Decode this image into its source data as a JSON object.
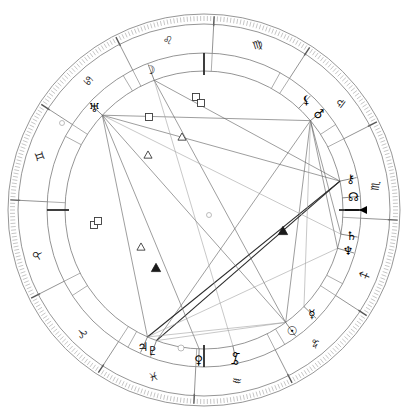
{
  "chart": {
    "type": "astrological-wheel",
    "center": {
      "x": 204,
      "y": 210
    },
    "radii": {
      "outer_edge": 196,
      "tick_outer": 194,
      "tick_inner": 186,
      "sign_ring_outer": 186,
      "sign_ring_inner": 157,
      "house_ring_outer": 157,
      "house_ring_inner": 139,
      "planet_ring": 150,
      "aspect_circle": 139
    },
    "rotation_note": "Ascendant at left (9 o'clock), zodiac increasing counter-clockwise",
    "asc_marker": {
      "label": "Ascendant",
      "angle_deg": 180,
      "symbol": "arrow-left"
    }
  },
  "zodiac_signs": [
    {
      "name": "Leo",
      "symbol": "♌",
      "angle_deg": 78,
      "label_angle": 78
    },
    {
      "name": "Cancer",
      "symbol": "♋",
      "angle_deg": 48,
      "label_angle": 48
    },
    {
      "name": "Gemini",
      "symbol": "♊",
      "angle_deg": 18,
      "label_angle": 18
    },
    {
      "name": "Taurus",
      "symbol": "♉",
      "angle_deg": 345,
      "label_angle": 345
    },
    {
      "name": "Aries",
      "symbol": "♈",
      "angle_deg": 315,
      "label_angle": 315
    },
    {
      "name": "Pisces",
      "symbol": "♓",
      "angle_deg": 287,
      "label_angle": 287
    },
    {
      "name": "Aquarius",
      "symbol": "♒",
      "angle_deg": 259,
      "label_angle": 259
    },
    {
      "name": "Capricorn",
      "symbol": "♑",
      "angle_deg": 230,
      "label_angle": 230
    },
    {
      "name": "Sagittarius",
      "symbol": "♐",
      "angle_deg": 202,
      "label_angle": 202
    },
    {
      "name": "Scorpio",
      "symbol": "♏",
      "angle_deg": 172,
      "label_angle": 172
    },
    {
      "name": "Libra",
      "symbol": "♎",
      "angle_deg": 142,
      "label_angle": 142
    },
    {
      "name": "Virgo",
      "symbol": "♍",
      "angle_deg": 108,
      "label_angle": 108
    }
  ],
  "sign_cusps_deg": [
    3,
    33,
    63,
    93,
    123,
    153,
    183,
    213,
    243,
    273,
    303,
    333
  ],
  "house_cusps": [
    {
      "house": 1,
      "angle_deg": 180,
      "major": true
    },
    {
      "house": 2,
      "angle_deg": 208,
      "major": false
    },
    {
      "house": 3,
      "angle_deg": 239,
      "major": false
    },
    {
      "house": 4,
      "angle_deg": 270,
      "major": true
    },
    {
      "house": 5,
      "angle_deg": 299,
      "major": false
    },
    {
      "house": 6,
      "angle_deg": 327,
      "major": false
    },
    {
      "house": 7,
      "angle_deg": 0,
      "major": true
    },
    {
      "house": 8,
      "angle_deg": 28,
      "major": false
    },
    {
      "house": 9,
      "angle_deg": 59,
      "major": false
    },
    {
      "house": 10,
      "angle_deg": 90,
      "major": true
    },
    {
      "house": 11,
      "angle_deg": 119,
      "major": false
    },
    {
      "house": 12,
      "angle_deg": 147,
      "major": false
    }
  ],
  "planets": [
    {
      "name": "Moon",
      "symbol": "☽",
      "angle_deg": 69,
      "label_r": 150,
      "point_r": 139
    },
    {
      "name": "Uranus",
      "symbol": "♅",
      "angle_deg": 43,
      "label_r": 150,
      "point_r": 139
    },
    {
      "name": "Mars",
      "symbol": "♂",
      "angle_deg": 140,
      "label_r": 150,
      "point_r": 139
    },
    {
      "name": "Lilith",
      "symbol": "⚸",
      "angle_deg": 133,
      "label_r": 150,
      "point_r": 139
    },
    {
      "name": "Chiron",
      "symbol": "⚷",
      "angle_deg": 168,
      "label_r": 150,
      "point_r": 139
    },
    {
      "name": "NorthNode",
      "symbol": "☊",
      "angle_deg": 175,
      "label_r": 150,
      "point_r": 139
    },
    {
      "name": "Saturn",
      "symbol": "♄",
      "angle_deg": 190,
      "label_r": 150,
      "point_r": 139
    },
    {
      "name": "Neptune",
      "symbol": "♆",
      "angle_deg": 196,
      "label_r": 150,
      "point_r": 139
    },
    {
      "name": "Mercury",
      "symbol": "☿",
      "angle_deg": 224,
      "label_r": 150,
      "point_r": 139
    },
    {
      "name": "Sun",
      "symbol": "☉",
      "angle_deg": 234,
      "label_r": 150,
      "point_r": 139
    },
    {
      "name": "Venus",
      "symbol": "♀",
      "angle_deg": 272,
      "label_r": 150,
      "point_r": 139
    },
    {
      "name": "Pluto",
      "symbol": "♇",
      "angle_deg": 290,
      "label_r": 150,
      "point_r": 139
    },
    {
      "name": "Jupiter",
      "symbol": "♃",
      "angle_deg": 294,
      "label_r": 150,
      "point_r": 139
    },
    {
      "name": "Pisces-pt",
      "symbol": "⯙",
      "angle_deg": 258,
      "label_r": 152,
      "point_r": 139
    }
  ],
  "inner_point_markers": [
    {
      "name": "marker-a",
      "angle_deg": 258,
      "r": 139
    }
  ],
  "aspect_lines": [
    {
      "from_deg": 140,
      "to_deg": 43,
      "style": "normal"
    },
    {
      "from_deg": 140,
      "to_deg": 234,
      "style": "normal"
    },
    {
      "from_deg": 140,
      "to_deg": 290,
      "style": "normal"
    },
    {
      "from_deg": 140,
      "to_deg": 196,
      "style": "normal"
    },
    {
      "from_deg": 140,
      "to_deg": 190,
      "style": "normal"
    },
    {
      "from_deg": 168,
      "to_deg": 43,
      "style": "normal"
    },
    {
      "from_deg": 168,
      "to_deg": 69,
      "style": "normal"
    },
    {
      "from_deg": 168,
      "to_deg": 294,
      "style": "dark"
    },
    {
      "from_deg": 168,
      "to_deg": 290,
      "style": "dark"
    },
    {
      "from_deg": 43,
      "to_deg": 234,
      "style": "normal"
    },
    {
      "from_deg": 43,
      "to_deg": 272,
      "style": "normal"
    },
    {
      "from_deg": 43,
      "to_deg": 294,
      "style": "normal"
    },
    {
      "from_deg": 69,
      "to_deg": 234,
      "style": "normal"
    },
    {
      "from_deg": 69,
      "to_deg": 258,
      "style": "faint"
    },
    {
      "from_deg": 234,
      "to_deg": 290,
      "style": "faint"
    },
    {
      "from_deg": 234,
      "to_deg": 294,
      "style": "faint"
    },
    {
      "from_deg": 196,
      "to_deg": 294,
      "style": "faint"
    },
    {
      "from_deg": 190,
      "to_deg": 43,
      "style": "faint"
    },
    {
      "from_deg": 224,
      "to_deg": 140,
      "style": "faint"
    }
  ],
  "aspect_markers": [
    {
      "type": "square",
      "shape": "open",
      "x": 196,
      "y": 97,
      "size": 7
    },
    {
      "type": "square",
      "shape": "open",
      "x": 201,
      "y": 103,
      "size": 7
    },
    {
      "type": "square",
      "shape": "open",
      "x": 149,
      "y": 117,
      "size": 7
    },
    {
      "type": "square",
      "shape": "open",
      "x": 94,
      "y": 225,
      "size": 7
    },
    {
      "type": "square",
      "shape": "open",
      "x": 98,
      "y": 221,
      "size": 7
    },
    {
      "type": "trine",
      "shape": "open",
      "x": 182,
      "y": 137,
      "size": 7
    },
    {
      "type": "trine",
      "shape": "open",
      "x": 148,
      "y": 155,
      "size": 7
    },
    {
      "type": "trine",
      "shape": "open",
      "x": 141,
      "y": 247,
      "size": 7
    },
    {
      "type": "trine",
      "shape": "solid",
      "x": 156,
      "y": 268,
      "size": 8
    },
    {
      "type": "trine",
      "shape": "solid",
      "x": 283,
      "y": 231,
      "size": 8
    },
    {
      "type": "conj",
      "shape": "faint",
      "x": 209,
      "y": 215,
      "size": 5
    },
    {
      "type": "conj",
      "shape": "faint",
      "x": 62,
      "y": 123,
      "size": 5
    },
    {
      "type": "conj",
      "shape": "faint",
      "x": 181,
      "y": 348,
      "size": 6
    }
  ],
  "legend": {
    "aspect_types": [
      {
        "name": "Square",
        "glyph": "□"
      },
      {
        "name": "Trine",
        "glyph": "△"
      },
      {
        "name": "Sextile",
        "glyph": "∗"
      }
    ]
  }
}
